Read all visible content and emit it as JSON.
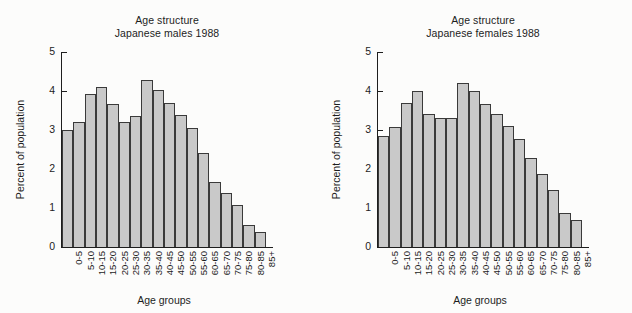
{
  "figure": {
    "background": "#fcfcfb",
    "bar_fill": "#c9c9c9",
    "bar_edge": "#3a3a3a",
    "axis_color": "#1e1e1e"
  },
  "panels": [
    {
      "id": "males",
      "title_line1": "Age structure",
      "title_line2": "Japanese males 1988"
    },
    {
      "id": "females",
      "title_line1": "Age structure",
      "title_line2": "Japanese females 1988"
    }
  ],
  "axes": {
    "ylabel": "Percent of population",
    "xlabel": "Age groups",
    "yticks": [
      0,
      1,
      2,
      3,
      4,
      5
    ],
    "ytick_labels": [
      "0",
      "1",
      "2",
      "3",
      "4",
      "5"
    ],
    "ylim": [
      0,
      5
    ]
  },
  "chart_data": [
    {
      "type": "bar",
      "title": "Age structure Japanese males 1988",
      "xlabel": "Age groups",
      "ylabel": "Percent of population",
      "ylim": [
        0,
        5
      ],
      "yticks": [
        0,
        1,
        2,
        3,
        4,
        5
      ],
      "grid": false,
      "legend": "none",
      "categories": [
        "0-5",
        "5-10",
        "10-15",
        "15-20",
        "20-25",
        "25-30",
        "30-35",
        "35-40",
        "40-45",
        "45-50",
        "50-55",
        "55-60",
        "60-65",
        "65-70",
        "70-75",
        "75-80",
        "80-85",
        "85+"
      ],
      "values": [
        3.0,
        3.2,
        3.92,
        4.1,
        3.66,
        3.2,
        3.35,
        4.28,
        4.02,
        3.7,
        3.38,
        3.06,
        2.4,
        1.66,
        1.38,
        1.08,
        0.56,
        0.38
      ]
    },
    {
      "type": "bar",
      "title": "Age structure Japanese females 1988",
      "xlabel": "Age groups",
      "ylabel": "Percent of population",
      "ylim": [
        0,
        5
      ],
      "yticks": [
        0,
        1,
        2,
        3,
        4,
        5
      ],
      "grid": false,
      "legend": "none",
      "categories": [
        "0-5",
        "5-10",
        "10-15",
        "15-20",
        "20-25",
        "25-30",
        "30-35",
        "35-40",
        "40-45",
        "45-50",
        "50-55",
        "55-60",
        "60-65",
        "65-70",
        "70-75",
        "75-80",
        "80-85",
        "85+"
      ],
      "values": [
        2.85,
        3.07,
        3.7,
        4.0,
        3.4,
        3.3,
        3.3,
        4.2,
        4.0,
        3.66,
        3.42,
        3.1,
        2.76,
        2.28,
        1.87,
        1.45,
        0.87,
        0.68
      ]
    }
  ]
}
